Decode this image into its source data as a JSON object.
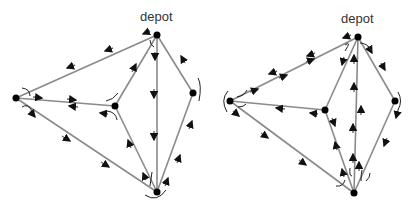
{
  "diagrams": [
    {
      "id": "left",
      "depot_label": "depot",
      "nodes": {
        "depot": [
          157,
          35
        ],
        "left": [
          16,
          98
        ],
        "center": [
          115,
          106
        ],
        "right": [
          193,
          93
        ],
        "bottom": [
          157,
          192
        ]
      }
    },
    {
      "id": "right",
      "depot_label": "depot",
      "nodes": {
        "depot": [
          358,
          37
        ],
        "left": [
          230,
          101
        ],
        "center": [
          325,
          110
        ],
        "right": [
          395,
          101
        ],
        "bottom": [
          354,
          193
        ]
      }
    }
  ],
  "colors": {
    "edge": "#8a8a8a",
    "node": "#000000",
    "arrow": "#111111"
  }
}
